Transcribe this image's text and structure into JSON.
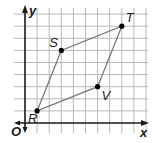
{
  "diagram": {
    "type": "coordinate-grid-parallelogram",
    "axes": {
      "x_label": "x",
      "y_label": "y",
      "origin_label": "O"
    },
    "grid": {
      "x_max": 10,
      "y_max": 9
    },
    "points": [
      {
        "name": "R",
        "x": 1,
        "y": 1
      },
      {
        "name": "S",
        "x": 3,
        "y": 6
      },
      {
        "name": "T",
        "x": 8,
        "y": 8
      },
      {
        "name": "V",
        "x": 6,
        "y": 3
      }
    ],
    "polygon": [
      "R",
      "S",
      "T",
      "V"
    ],
    "colors": {
      "grid": "#b8b8b8",
      "axis": "#1a1a1a",
      "edge": "#7a7a7a",
      "point": "#000000"
    }
  }
}
